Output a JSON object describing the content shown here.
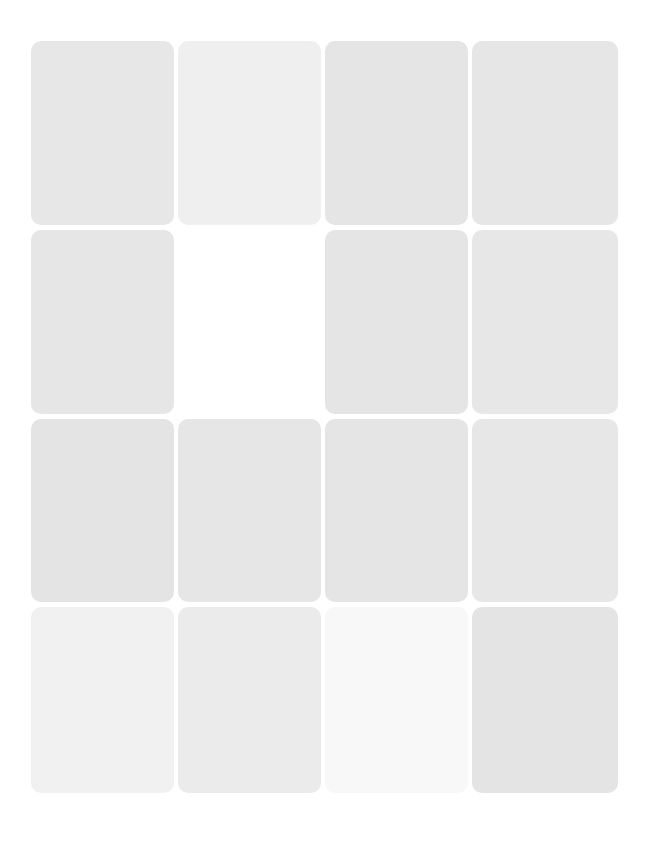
{
  "grid": {
    "rows": 4,
    "columns": 4,
    "cards": [
      {
        "row": 1,
        "col": 1,
        "color": "#e7e7e7",
        "text": ""
      },
      {
        "row": 1,
        "col": 2,
        "color": "#efefef",
        "text": ""
      },
      {
        "row": 1,
        "col": 3,
        "color": "#e5e5e5",
        "text": ""
      },
      {
        "row": 1,
        "col": 4,
        "color": "#e6e6e6",
        "text": ""
      },
      {
        "row": 2,
        "col": 1,
        "color": "#e6e6e6",
        "text": ""
      },
      {
        "row": 2,
        "col": 2,
        "color": "#ffffff",
        "text": ""
      },
      {
        "row": 2,
        "col": 3,
        "color": "#e5e5e5",
        "text": ""
      },
      {
        "row": 2,
        "col": 4,
        "color": "#e7e7e7",
        "text": ""
      },
      {
        "row": 3,
        "col": 1,
        "color": "#e4e4e4",
        "text": ""
      },
      {
        "row": 3,
        "col": 2,
        "color": "#e6e6e6",
        "text": ""
      },
      {
        "row": 3,
        "col": 3,
        "color": "#e5e5e5",
        "text": ""
      },
      {
        "row": 3,
        "col": 4,
        "color": "#e7e7e7",
        "text": ""
      },
      {
        "row": 4,
        "col": 1,
        "color": "#f1f1f1",
        "text": ""
      },
      {
        "row": 4,
        "col": 2,
        "color": "#ebebeb",
        "text": ""
      },
      {
        "row": 4,
        "col": 3,
        "color": "#f8f8f8",
        "text": ""
      },
      {
        "row": 4,
        "col": 4,
        "color": "#e4e4e4",
        "text": ""
      }
    ]
  }
}
